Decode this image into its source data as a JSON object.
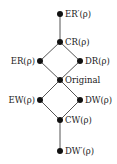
{
  "diagram": {
    "type": "lattice",
    "nodes": [
      {
        "id": "er_prime",
        "label": "ER′(ρ)",
        "label_side": "right"
      },
      {
        "id": "cr",
        "label": "CR(ρ)",
        "label_side": "right"
      },
      {
        "id": "er",
        "label": "ER(ρ)",
        "label_side": "left"
      },
      {
        "id": "dr",
        "label": "DR(ρ)",
        "label_side": "right"
      },
      {
        "id": "original",
        "label": "Original",
        "label_side": "right"
      },
      {
        "id": "ew",
        "label": "EW(ρ)",
        "label_side": "left"
      },
      {
        "id": "dw",
        "label": "DW(ρ)",
        "label_side": "right"
      },
      {
        "id": "cw",
        "label": "CW(ρ)",
        "label_side": "right"
      },
      {
        "id": "dw_prime",
        "label": "DW′(ρ)",
        "label_side": "right"
      }
    ],
    "edges": [
      [
        "er_prime",
        "cr"
      ],
      [
        "cr",
        "er"
      ],
      [
        "cr",
        "dr"
      ],
      [
        "er",
        "original"
      ],
      [
        "dr",
        "original"
      ],
      [
        "original",
        "ew"
      ],
      [
        "original",
        "dw"
      ],
      [
        "ew",
        "cw"
      ],
      [
        "dw",
        "cw"
      ],
      [
        "cw",
        "dw_prime"
      ]
    ]
  }
}
